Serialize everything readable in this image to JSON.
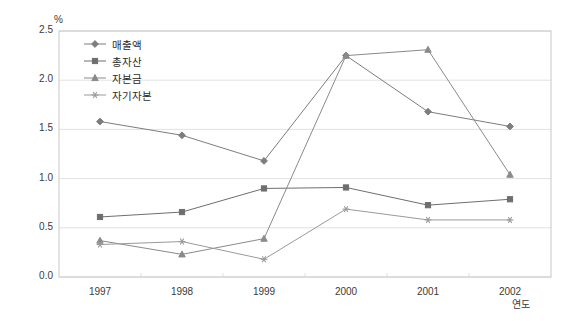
{
  "chart_data": {
    "type": "line",
    "title": "",
    "xlabel": "연도",
    "ylabel": "%",
    "ylim": [
      0.0,
      2.5
    ],
    "grid": true,
    "legend_position": "top-left",
    "categories": [
      "1997",
      "1998",
      "1999",
      "2000",
      "2001",
      "2002"
    ],
    "ytick_labels": [
      "0.0",
      "0.5",
      "1.0",
      "1.5",
      "2.0",
      "2.5"
    ],
    "ytick_values": [
      0.0,
      0.5,
      1.0,
      1.5,
      2.0,
      2.5
    ],
    "series": [
      {
        "name": "매출액",
        "marker": "diamond",
        "color": "#7d7d7d",
        "values": [
          1.58,
          1.44,
          1.18,
          2.25,
          1.68,
          1.53
        ]
      },
      {
        "name": "총자산",
        "marker": "square",
        "color": "#6e6e6e",
        "values": [
          0.61,
          0.66,
          0.9,
          0.91,
          0.73,
          0.79
        ]
      },
      {
        "name": "자본금",
        "marker": "triangle",
        "color": "#8a8a8a",
        "values": [
          0.37,
          0.23,
          0.39,
          2.25,
          2.31,
          1.04
        ]
      },
      {
        "name": "자기자본",
        "marker": "asterisk",
        "color": "#9a9a9a",
        "values": [
          0.33,
          0.36,
          0.18,
          0.69,
          0.58,
          0.58
        ]
      }
    ]
  },
  "axes": {
    "y_unit": "%",
    "x_unit": "연도"
  },
  "colors": {
    "frame": "#c8c8c8",
    "grid": "#e2e2e2",
    "text": "#3a3a3a",
    "background": "#ffffff"
  }
}
